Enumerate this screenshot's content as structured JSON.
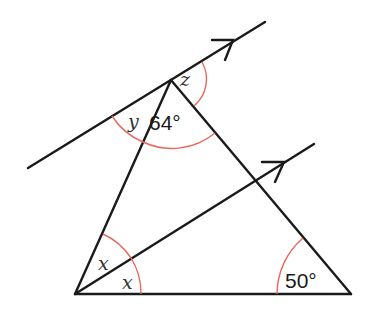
{
  "diagram": {
    "type": "geometry",
    "labels": {
      "apex_left_angle": "y",
      "apex_interior_angle": "64°",
      "apex_right_angle": "z",
      "bottom_left_upper_angle": "x",
      "bottom_left_lower_angle": "x",
      "bottom_right_angle": "50°"
    },
    "colors": {
      "lines": "#1a1a1a",
      "angle_arcs": "#e8685a"
    }
  }
}
